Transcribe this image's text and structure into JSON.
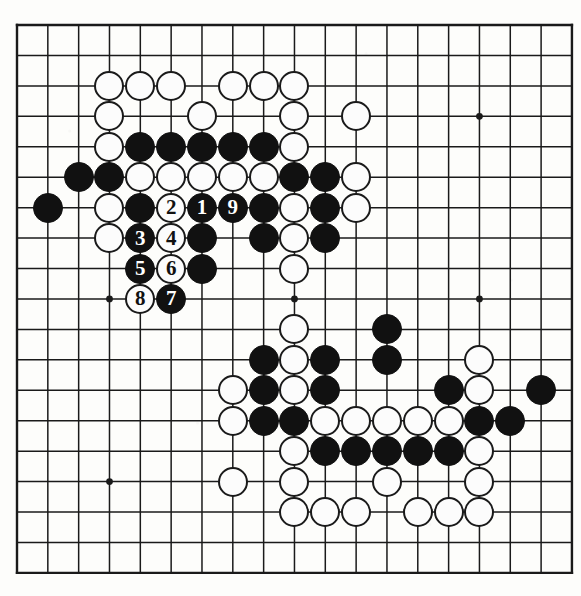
{
  "board": {
    "kind": "go-board-diagram",
    "size": 19,
    "geometry": {
      "origin_x": 17,
      "origin_y": 25,
      "step_x": 30.83,
      "step_y": 30.44,
      "stone_diameter": 30,
      "line_color": "#1a1a1a",
      "edge_line_width": 2.4,
      "inner_line_width": 1.5,
      "background_color": "#fdfdfb",
      "black_color": "#111111",
      "white_color": "#fcfcfc"
    },
    "star_points": [
      {
        "col": 3,
        "row": 3
      },
      {
        "col": 9,
        "row": 3
      },
      {
        "col": 15,
        "row": 3
      },
      {
        "col": 3,
        "row": 9
      },
      {
        "col": 9,
        "row": 9
      },
      {
        "col": 15,
        "row": 9
      },
      {
        "col": 3,
        "row": 15
      },
      {
        "col": 9,
        "row": 15
      },
      {
        "col": 15,
        "row": 15
      }
    ],
    "stones": [
      {
        "col": 3,
        "row": 2,
        "color": "white",
        "label": ""
      },
      {
        "col": 4,
        "row": 2,
        "color": "white",
        "label": ""
      },
      {
        "col": 5,
        "row": 2,
        "color": "white",
        "label": ""
      },
      {
        "col": 7,
        "row": 2,
        "color": "white",
        "label": ""
      },
      {
        "col": 8,
        "row": 2,
        "color": "white",
        "label": ""
      },
      {
        "col": 9,
        "row": 2,
        "color": "white",
        "label": ""
      },
      {
        "col": 3,
        "row": 3,
        "color": "white",
        "label": ""
      },
      {
        "col": 6,
        "row": 3,
        "color": "white",
        "label": ""
      },
      {
        "col": 9,
        "row": 3,
        "color": "white",
        "label": ""
      },
      {
        "col": 11,
        "row": 3,
        "color": "white",
        "label": ""
      },
      {
        "col": 3,
        "row": 4,
        "color": "white",
        "label": ""
      },
      {
        "col": 4,
        "row": 4,
        "color": "black",
        "label": ""
      },
      {
        "col": 5,
        "row": 4,
        "color": "black",
        "label": ""
      },
      {
        "col": 6,
        "row": 4,
        "color": "black",
        "label": ""
      },
      {
        "col": 7,
        "row": 4,
        "color": "black",
        "label": ""
      },
      {
        "col": 8,
        "row": 4,
        "color": "black",
        "label": ""
      },
      {
        "col": 9,
        "row": 4,
        "color": "white",
        "label": ""
      },
      {
        "col": 2,
        "row": 5,
        "color": "black",
        "label": ""
      },
      {
        "col": 3,
        "row": 5,
        "color": "black",
        "label": ""
      },
      {
        "col": 4,
        "row": 5,
        "color": "white",
        "label": ""
      },
      {
        "col": 5,
        "row": 5,
        "color": "white",
        "label": ""
      },
      {
        "col": 6,
        "row": 5,
        "color": "white",
        "label": ""
      },
      {
        "col": 7,
        "row": 5,
        "color": "white",
        "label": ""
      },
      {
        "col": 8,
        "row": 5,
        "color": "white",
        "label": ""
      },
      {
        "col": 9,
        "row": 5,
        "color": "black",
        "label": ""
      },
      {
        "col": 10,
        "row": 5,
        "color": "black",
        "label": ""
      },
      {
        "col": 11,
        "row": 5,
        "color": "white",
        "label": ""
      },
      {
        "col": 1,
        "row": 6,
        "color": "black",
        "label": ""
      },
      {
        "col": 3,
        "row": 6,
        "color": "white",
        "label": ""
      },
      {
        "col": 4,
        "row": 6,
        "color": "black",
        "label": ""
      },
      {
        "col": 5,
        "row": 6,
        "color": "white",
        "label": "2"
      },
      {
        "col": 6,
        "row": 6,
        "color": "black",
        "label": "1"
      },
      {
        "col": 7,
        "row": 6,
        "color": "black",
        "label": "9"
      },
      {
        "col": 8,
        "row": 6,
        "color": "black",
        "label": ""
      },
      {
        "col": 9,
        "row": 6,
        "color": "white",
        "label": ""
      },
      {
        "col": 10,
        "row": 6,
        "color": "black",
        "label": ""
      },
      {
        "col": 11,
        "row": 6,
        "color": "white",
        "label": ""
      },
      {
        "col": 3,
        "row": 7,
        "color": "white",
        "label": ""
      },
      {
        "col": 4,
        "row": 7,
        "color": "black",
        "label": "3"
      },
      {
        "col": 5,
        "row": 7,
        "color": "white",
        "label": "4"
      },
      {
        "col": 6,
        "row": 7,
        "color": "black",
        "label": ""
      },
      {
        "col": 8,
        "row": 7,
        "color": "black",
        "label": ""
      },
      {
        "col": 9,
        "row": 7,
        "color": "white",
        "label": ""
      },
      {
        "col": 10,
        "row": 7,
        "color": "black",
        "label": ""
      },
      {
        "col": 4,
        "row": 8,
        "color": "black",
        "label": "5"
      },
      {
        "col": 5,
        "row": 8,
        "color": "white",
        "label": "6"
      },
      {
        "col": 6,
        "row": 8,
        "color": "black",
        "label": ""
      },
      {
        "col": 9,
        "row": 8,
        "color": "white",
        "label": ""
      },
      {
        "col": 4,
        "row": 9,
        "color": "white",
        "label": "8"
      },
      {
        "col": 5,
        "row": 9,
        "color": "black",
        "label": "7"
      },
      {
        "col": 9,
        "row": 10,
        "color": "white",
        "label": ""
      },
      {
        "col": 12,
        "row": 10,
        "color": "black",
        "label": ""
      },
      {
        "col": 8,
        "row": 11,
        "color": "black",
        "label": ""
      },
      {
        "col": 9,
        "row": 11,
        "color": "white",
        "label": ""
      },
      {
        "col": 10,
        "row": 11,
        "color": "black",
        "label": ""
      },
      {
        "col": 12,
        "row": 11,
        "color": "black",
        "label": ""
      },
      {
        "col": 15,
        "row": 11,
        "color": "white",
        "label": ""
      },
      {
        "col": 7,
        "row": 12,
        "color": "white",
        "label": ""
      },
      {
        "col": 8,
        "row": 12,
        "color": "black",
        "label": ""
      },
      {
        "col": 9,
        "row": 12,
        "color": "white",
        "label": ""
      },
      {
        "col": 10,
        "row": 12,
        "color": "black",
        "label": ""
      },
      {
        "col": 14,
        "row": 12,
        "color": "black",
        "label": ""
      },
      {
        "col": 15,
        "row": 12,
        "color": "white",
        "label": ""
      },
      {
        "col": 17,
        "row": 12,
        "color": "black",
        "label": ""
      },
      {
        "col": 7,
        "row": 13,
        "color": "white",
        "label": ""
      },
      {
        "col": 8,
        "row": 13,
        "color": "black",
        "label": ""
      },
      {
        "col": 9,
        "row": 13,
        "color": "black",
        "label": ""
      },
      {
        "col": 10,
        "row": 13,
        "color": "white",
        "label": ""
      },
      {
        "col": 11,
        "row": 13,
        "color": "white",
        "label": ""
      },
      {
        "col": 12,
        "row": 13,
        "color": "white",
        "label": ""
      },
      {
        "col": 13,
        "row": 13,
        "color": "white",
        "label": ""
      },
      {
        "col": 14,
        "row": 13,
        "color": "white",
        "label": ""
      },
      {
        "col": 15,
        "row": 13,
        "color": "black",
        "label": ""
      },
      {
        "col": 16,
        "row": 13,
        "color": "black",
        "label": ""
      },
      {
        "col": 9,
        "row": 14,
        "color": "white",
        "label": ""
      },
      {
        "col": 10,
        "row": 14,
        "color": "black",
        "label": ""
      },
      {
        "col": 11,
        "row": 14,
        "color": "black",
        "label": ""
      },
      {
        "col": 12,
        "row": 14,
        "color": "black",
        "label": ""
      },
      {
        "col": 13,
        "row": 14,
        "color": "black",
        "label": ""
      },
      {
        "col": 14,
        "row": 14,
        "color": "black",
        "label": ""
      },
      {
        "col": 15,
        "row": 14,
        "color": "white",
        "label": ""
      },
      {
        "col": 7,
        "row": 15,
        "color": "white",
        "label": ""
      },
      {
        "col": 9,
        "row": 15,
        "color": "white",
        "label": ""
      },
      {
        "col": 12,
        "row": 15,
        "color": "white",
        "label": ""
      },
      {
        "col": 15,
        "row": 15,
        "color": "white",
        "label": ""
      },
      {
        "col": 9,
        "row": 16,
        "color": "white",
        "label": ""
      },
      {
        "col": 10,
        "row": 16,
        "color": "white",
        "label": ""
      },
      {
        "col": 11,
        "row": 16,
        "color": "white",
        "label": ""
      },
      {
        "col": 13,
        "row": 16,
        "color": "white",
        "label": ""
      },
      {
        "col": 14,
        "row": 16,
        "color": "white",
        "label": ""
      },
      {
        "col": 15,
        "row": 16,
        "color": "white",
        "label": ""
      }
    ],
    "move_sequence": [
      {
        "number": "1",
        "color": "black",
        "col": 6,
        "row": 6
      },
      {
        "number": "2",
        "color": "white",
        "col": 5,
        "row": 6
      },
      {
        "number": "3",
        "color": "black",
        "col": 4,
        "row": 7
      },
      {
        "number": "4",
        "color": "white",
        "col": 5,
        "row": 7
      },
      {
        "number": "5",
        "color": "black",
        "col": 4,
        "row": 8
      },
      {
        "number": "6",
        "color": "white",
        "col": 5,
        "row": 8
      },
      {
        "number": "7",
        "color": "black",
        "col": 5,
        "row": 9
      },
      {
        "number": "8",
        "color": "white",
        "col": 4,
        "row": 9
      },
      {
        "number": "9",
        "color": "black",
        "col": 7,
        "row": 6
      }
    ]
  }
}
